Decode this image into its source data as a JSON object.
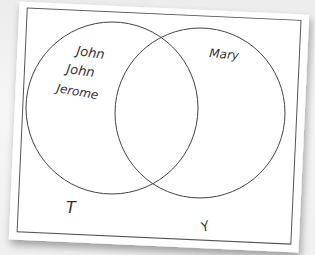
{
  "diagram": {
    "type": "venn",
    "sets": [
      {
        "label": "T",
        "members": [
          "John",
          "John",
          "Jerome"
        ]
      },
      {
        "label": "Y",
        "members": [
          "Mary"
        ]
      }
    ],
    "intersection": []
  },
  "labels": {
    "set_left": "T",
    "set_right": "Y",
    "left_members": [
      "John",
      "John",
      "Jerome"
    ],
    "right_members": [
      "Mary"
    ]
  },
  "colors": {
    "line": "#444444",
    "paper": "#ffffff",
    "background": "#f2f2f2"
  }
}
